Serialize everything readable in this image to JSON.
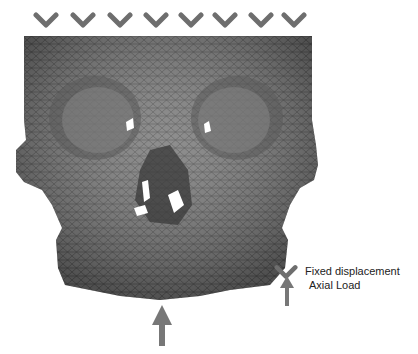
{
  "figure": {
    "fixed_constraint_count": 8,
    "colors": {
      "mesh": "#6b6b6b",
      "mesh_dark": "#3c3c3c",
      "arrow": "#777777",
      "background": "#ffffff"
    }
  },
  "legend": {
    "items": [
      {
        "icon": "chevron-down-icon",
        "label": "Fixed displacement"
      },
      {
        "icon": "arrow-up-icon",
        "label": "Axial Load"
      }
    ]
  }
}
